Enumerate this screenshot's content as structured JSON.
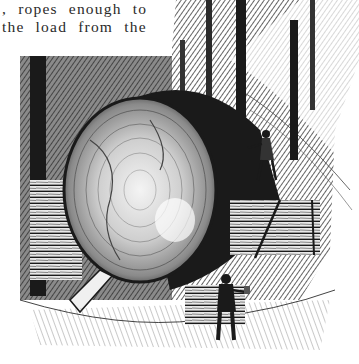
{
  "page": {
    "type": "scanned-book-page",
    "text_lines": [
      ", ropes enough to",
      "the load from the"
    ]
  },
  "illustration": {
    "description": "Engraving of a giant felled tree log cross-section resting on stacked timber cribbing in a forest, with a man standing on the cribbing at right and a man with an axe in the foreground",
    "colors": {
      "ink": "#1a1a1a",
      "paper": "#ffffff",
      "mid": "#6a6a6a"
    }
  }
}
